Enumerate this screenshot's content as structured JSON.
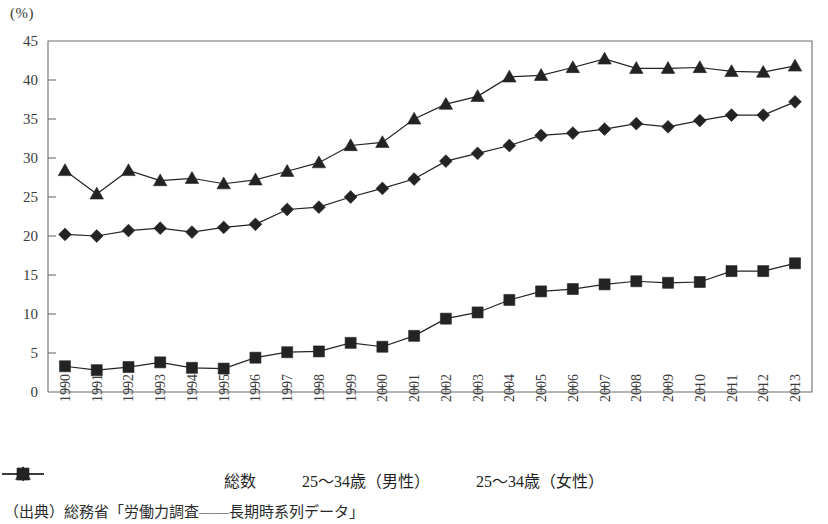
{
  "unit_label": "(%)",
  "source_note": "（出典）総務省「労働力調査——長期時系列データ」",
  "legend": {
    "items": [
      {
        "label": "総数",
        "marker": "diamond-marker-icon"
      },
      {
        "label": "25〜34歳（男性）",
        "marker": "square-marker-icon"
      },
      {
        "label": "25〜34歳（女性）",
        "marker": "triangle-marker-icon"
      }
    ]
  },
  "colors": {
    "ink": "#232323",
    "axis": "#6d6d6d",
    "background": "#ffffff"
  },
  "chart_data": {
    "type": "line",
    "title": "",
    "xlabel": "",
    "ylabel": "",
    "unit": "(%)",
    "ylim": [
      0,
      45
    ],
    "yticks": [
      0,
      5,
      10,
      15,
      20,
      25,
      30,
      35,
      40,
      45
    ],
    "grid": false,
    "legend_position": "bottom",
    "categories": [
      "1990",
      "1991",
      "1992",
      "1993",
      "1994",
      "1995",
      "1996",
      "1997",
      "1998",
      "1999",
      "2000",
      "2001",
      "2002",
      "2003",
      "2004",
      "2005",
      "2006",
      "2007",
      "2008",
      "2009",
      "2010",
      "2011",
      "2012",
      "2013"
    ],
    "series": [
      {
        "name": "総数",
        "marker": "diamond",
        "values": [
          20.2,
          20.0,
          20.7,
          21.0,
          20.5,
          21.1,
          21.5,
          23.4,
          23.7,
          25.0,
          26.1,
          27.3,
          29.6,
          30.6,
          31.6,
          32.9,
          33.2,
          33.7,
          34.4,
          34.0,
          34.8,
          35.5,
          35.5,
          37.2
        ]
      },
      {
        "name": "25〜34歳（男性）",
        "marker": "square",
        "values": [
          3.3,
          2.8,
          3.2,
          3.8,
          3.1,
          3.0,
          4.4,
          5.1,
          5.2,
          6.3,
          5.8,
          7.2,
          9.4,
          10.2,
          11.8,
          12.9,
          13.2,
          13.8,
          14.2,
          14.0,
          14.1,
          15.5,
          15.5,
          16.5
        ]
      },
      {
        "name": "25〜34歳（女性）",
        "marker": "triangle",
        "values": [
          28.4,
          25.4,
          28.4,
          27.1,
          27.4,
          26.7,
          27.2,
          28.3,
          29.4,
          31.6,
          32.0,
          35.0,
          36.9,
          37.9,
          40.4,
          40.6,
          41.6,
          42.7,
          41.5,
          41.5,
          41.6,
          41.1,
          41.0,
          41.8
        ]
      }
    ]
  }
}
